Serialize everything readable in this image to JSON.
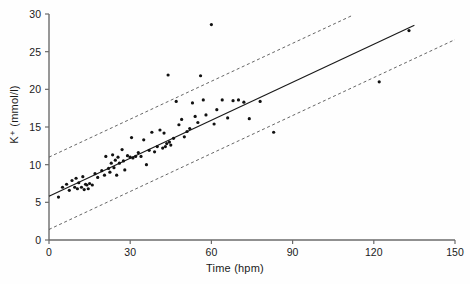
{
  "chart_data": {
    "type": "scatter",
    "title": "",
    "xlabel": "Time (hpm)",
    "ylabel": "K⁺ (mmol/l)",
    "xlim": [
      0,
      150
    ],
    "ylim": [
      0,
      30
    ],
    "xticks": [
      0,
      30,
      60,
      90,
      120,
      150
    ],
    "yticks": [
      0,
      5,
      10,
      15,
      20,
      25,
      30
    ],
    "grid": false,
    "legend": null,
    "series": [
      {
        "name": "K+ measurements",
        "type": "scatter",
        "marker": "dot",
        "color": "#111111",
        "points": [
          [
            3.5,
            5.7
          ],
          [
            5.0,
            7.0
          ],
          [
            6.5,
            7.4
          ],
          [
            7.5,
            6.6
          ],
          [
            8.5,
            7.9
          ],
          [
            9.5,
            7.0
          ],
          [
            10.0,
            8.2
          ],
          [
            10.5,
            6.8
          ],
          [
            11.0,
            7.6
          ],
          [
            12.0,
            7.0
          ],
          [
            12.5,
            8.4
          ],
          [
            13.0,
            6.7
          ],
          [
            13.5,
            7.4
          ],
          [
            14.0,
            7.3
          ],
          [
            14.5,
            6.8
          ],
          [
            15.0,
            7.5
          ],
          [
            16.0,
            7.3
          ],
          [
            17.0,
            8.8
          ],
          [
            18.0,
            8.3
          ],
          [
            19.5,
            9.2
          ],
          [
            20.5,
            8.6
          ],
          [
            21.0,
            11.1
          ],
          [
            22.0,
            9.5
          ],
          [
            22.5,
            9.0
          ],
          [
            23.0,
            10.2
          ],
          [
            23.5,
            11.3
          ],
          [
            24.0,
            9.6
          ],
          [
            24.5,
            10.6
          ],
          [
            25.0,
            8.6
          ],
          [
            25.5,
            11.0
          ],
          [
            26.0,
            10.2
          ],
          [
            27.0,
            12.0
          ],
          [
            27.5,
            10.5
          ],
          [
            28.0,
            9.3
          ],
          [
            29.0,
            11.2
          ],
          [
            30.0,
            11.0
          ],
          [
            30.5,
            13.6
          ],
          [
            31.0,
            10.9
          ],
          [
            32.0,
            11.1
          ],
          [
            33.0,
            11.6
          ],
          [
            34.0,
            11.1
          ],
          [
            35.0,
            13.3
          ],
          [
            36.0,
            10.0
          ],
          [
            37.0,
            11.9
          ],
          [
            38.0,
            14.3
          ],
          [
            39.0,
            11.7
          ],
          [
            40.0,
            12.4
          ],
          [
            41.0,
            14.6
          ],
          [
            42.0,
            12.2
          ],
          [
            42.5,
            14.2
          ],
          [
            43.0,
            12.4
          ],
          [
            43.5,
            12.8
          ],
          [
            44.0,
            21.9
          ],
          [
            44.5,
            13.0
          ],
          [
            45.0,
            12.6
          ],
          [
            46.0,
            13.5
          ],
          [
            47.0,
            18.4
          ],
          [
            48.0,
            15.3
          ],
          [
            49.0,
            16.0
          ],
          [
            50.0,
            13.7
          ],
          [
            51.0,
            14.4
          ],
          [
            52.0,
            14.8
          ],
          [
            53.0,
            18.2
          ],
          [
            54.0,
            16.4
          ],
          [
            55.0,
            15.6
          ],
          [
            56.0,
            21.8
          ],
          [
            57.0,
            18.6
          ],
          [
            58.0,
            16.6
          ],
          [
            60.0,
            28.6
          ],
          [
            61.0,
            15.4
          ],
          [
            62.0,
            17.3
          ],
          [
            64.0,
            18.6
          ],
          [
            66.0,
            16.2
          ],
          [
            68.0,
            18.5
          ],
          [
            70.0,
            18.6
          ],
          [
            72.0,
            18.3
          ],
          [
            74.0,
            16.1
          ],
          [
            78.0,
            18.4
          ],
          [
            83.0,
            14.3
          ],
          [
            122.0,
            21.0
          ],
          [
            133.0,
            27.8
          ]
        ]
      },
      {
        "name": "regression line",
        "type": "line",
        "style": "solid",
        "color": "#1a1a1a",
        "x": [
          0,
          135
        ],
        "y": [
          5.8,
          28.5
        ]
      },
      {
        "name": "upper prediction limit",
        "type": "line",
        "style": "dashed",
        "color": "#555555",
        "x": [
          0,
          112
        ],
        "y": [
          11.0,
          29.8
        ]
      },
      {
        "name": "lower prediction limit",
        "type": "line",
        "style": "dashed",
        "color": "#555555",
        "x": [
          0,
          150
        ],
        "y": [
          1.4,
          26.6
        ]
      }
    ]
  },
  "axes": {
    "x_label": "Time (hpm)",
    "y_label": "K⁺ (mmol/l)",
    "x_tick_labels": [
      "0",
      "30",
      "60",
      "90",
      "120",
      "150"
    ],
    "y_tick_labels": [
      "0",
      "5",
      "10",
      "15",
      "20",
      "25",
      "30"
    ]
  },
  "colors": {
    "axis": "#6b6b6b",
    "point": "#111111",
    "fit_line": "#1a1a1a",
    "band_line": "#666666",
    "text": "#1a1a1a"
  }
}
